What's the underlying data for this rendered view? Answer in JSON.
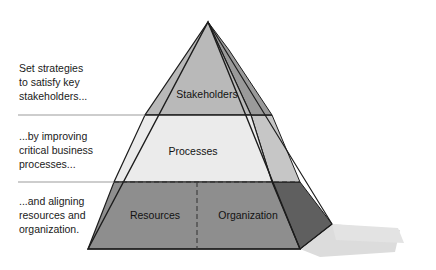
{
  "diagram": {
    "tiers": [
      {
        "id": "stakeholders",
        "label": "Stakeholders",
        "face_color": "#b9b9b9",
        "side_color": "#9a9a9a"
      },
      {
        "id": "processes",
        "label": "Processes",
        "face_color": "#ebebeb",
        "side_color": "#c6c6c6"
      },
      {
        "id": "resources",
        "label": "Resources",
        "face_color": "#8e8e8e",
        "side_color": "#5f5f5f"
      },
      {
        "id": "organization",
        "label": "Organization",
        "face_color": "#8e8e8e",
        "side_color": "#5f5f5f"
      }
    ],
    "outline_color": "#1c1c1c",
    "shadow_color": "#d8d8d8",
    "divider_color": "#9b9b9b"
  },
  "captions": [
    {
      "id": "strategies",
      "lines": [
        "Set strategies",
        "to satisfy key",
        "stakeholders..."
      ]
    },
    {
      "id": "processes",
      "lines": [
        "...by improving",
        "critical business",
        "processes..."
      ]
    },
    {
      "id": "resources",
      "lines": [
        "...and aligning",
        "resources and",
        "organization."
      ]
    }
  ]
}
